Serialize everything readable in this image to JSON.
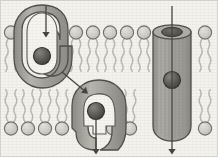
{
  "figure": {
    "caption": "",
    "width": 218,
    "height": 157,
    "background_color": "#f3f2ed",
    "border_color": "#d8d6cf"
  },
  "colors": {
    "background": "#f3f2ed",
    "lipid_head_fill": "#cfcec9",
    "lipid_head_stroke": "#6f6e6a",
    "lipid_tail": "#b9b8b2",
    "protein_fill": "#9b9a94",
    "protein_fill_light": "#b3b2ab",
    "protein_stroke": "#4f4e4a",
    "channel_fill": "#a3a29b",
    "channel_stripe": "#8e8d86",
    "channel_pore": "#55544f",
    "solute_fill": "#5e5d58",
    "solute_stroke": "#33322f",
    "cavity_fill": "#f5f4ef",
    "arrow_color": "#44433f"
  },
  "membrane": {
    "name": "phospholipid-bilayer",
    "upper_leaflet": {
      "label": "upper leaflet",
      "head_radius": 6.6,
      "head_center_y": 32.5,
      "tail_length": 34,
      "head_x_positions": [
        11,
        76,
        93,
        110,
        127,
        144,
        205
      ]
    },
    "lower_leaflet": {
      "label": "lower leaflet",
      "head_radius": 6.6,
      "head_center_y": 128.5,
      "tail_length": 34,
      "head_x_positions": [
        11,
        28,
        45,
        62,
        113,
        130,
        205
      ]
    }
  },
  "proteins": [
    {
      "id": "carrier-open-outward",
      "type": "carrier protein",
      "label": "carrier protein (open to outside)",
      "state": "open upward / solute bound",
      "center_x": 41,
      "center_y": 56,
      "solute": {
        "label": "transported solute",
        "cx": 42,
        "cy": 56,
        "r": 8.5
      }
    },
    {
      "id": "carrier-open-inward",
      "type": "carrier protein",
      "label": "carrier protein (open to inside)",
      "state": "open downward / releasing solute",
      "center_x": 96,
      "center_y": 110,
      "solute": {
        "label": "transported solute",
        "cx": 96,
        "cy": 111,
        "r": 8.5
      }
    },
    {
      "id": "channel-protein",
      "type": "channel protein",
      "label": "channel protein",
      "state": "open pore",
      "center_x": 172,
      "top_y": 28,
      "bottom_y": 134,
      "width": 38,
      "solute": {
        "label": "transported solute",
        "cx": 172,
        "cy": 80,
        "r": 8.5
      },
      "pore": {
        "label": "pore opening",
        "cx": 172,
        "cy": 32,
        "rx": 10.5,
        "ry": 5
      }
    }
  ],
  "arrows": [
    {
      "id": "arrow-into-carrier",
      "label": "solute entering carrier protein",
      "direction": "down",
      "x1": 46,
      "y1": 6,
      "x2": 46,
      "y2": 35
    },
    {
      "id": "arrow-conformational-change",
      "label": "conformational change",
      "direction": "down-right diagonal",
      "x1": 62,
      "y1": 72,
      "x2": 86,
      "y2": 92
    },
    {
      "id": "arrow-out-of-carrier",
      "label": "solute released inside cell",
      "direction": "down",
      "x1": 96,
      "y1": 118,
      "x2": 96,
      "y2": 152
    },
    {
      "id": "arrow-through-channel",
      "label": "solute diffusing through channel",
      "direction": "down",
      "x1": 172,
      "y1": 6,
      "x2": 172,
      "y2": 152
    }
  ]
}
